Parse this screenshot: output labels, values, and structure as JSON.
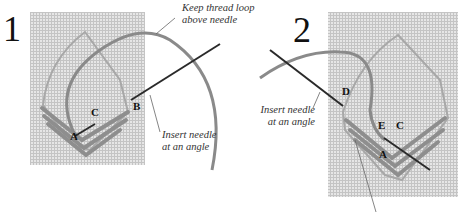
{
  "colors": {
    "canvas": "#dcdcdc",
    "thread": "#8c8c8c",
    "needle": "#2a2a2a",
    "leader": "#666666"
  },
  "steps": [
    {
      "number": "1",
      "captions": [
        "Keep thread loop above needle",
        "Insert needle at an angle"
      ],
      "caption_lines": [
        [
          "Keep thread loop",
          "above needle"
        ],
        [
          "Insert needle",
          "at an angle"
        ]
      ],
      "points": [
        "A",
        "B",
        "C"
      ]
    },
    {
      "number": "2",
      "captions": [
        "Insert needle at an angle"
      ],
      "caption_lines": [
        [
          "Insert needle",
          "at an angle"
        ]
      ],
      "points": [
        "A",
        "C",
        "D",
        "E"
      ]
    }
  ]
}
